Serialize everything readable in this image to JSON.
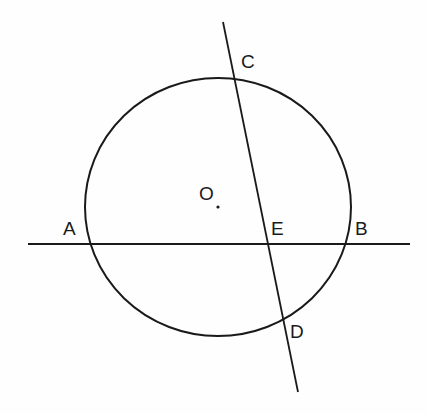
{
  "diagram": {
    "type": "geometry-circle-intersecting-chords",
    "stroke_color": "#1a1a1a",
    "background": "#fefefe",
    "circle": {
      "center_label": "O",
      "cx": 218,
      "cy": 207,
      "rx": 133,
      "ry": 129
    },
    "lines": [
      {
        "name": "line-AB",
        "x1": 28,
        "y1": 244,
        "x2": 410,
        "y2": 244
      },
      {
        "name": "line-CD",
        "x1": 223,
        "y1": 22,
        "x2": 298,
        "y2": 392
      }
    ],
    "points": {
      "A": {
        "label": "A",
        "x": 90,
        "y": 244
      },
      "B": {
        "label": "B",
        "x": 346,
        "y": 244
      },
      "C": {
        "label": "C",
        "x": 235,
        "y": 79
      },
      "D": {
        "label": "D",
        "x": 284,
        "y": 320
      },
      "E": {
        "label": "E",
        "x": 268,
        "y": 244
      },
      "O": {
        "label": "O",
        "x": 218,
        "y": 207
      }
    },
    "labels": {
      "A": "A",
      "B": "B",
      "C": "C",
      "D": "D",
      "E": "E",
      "O": "O"
    }
  }
}
